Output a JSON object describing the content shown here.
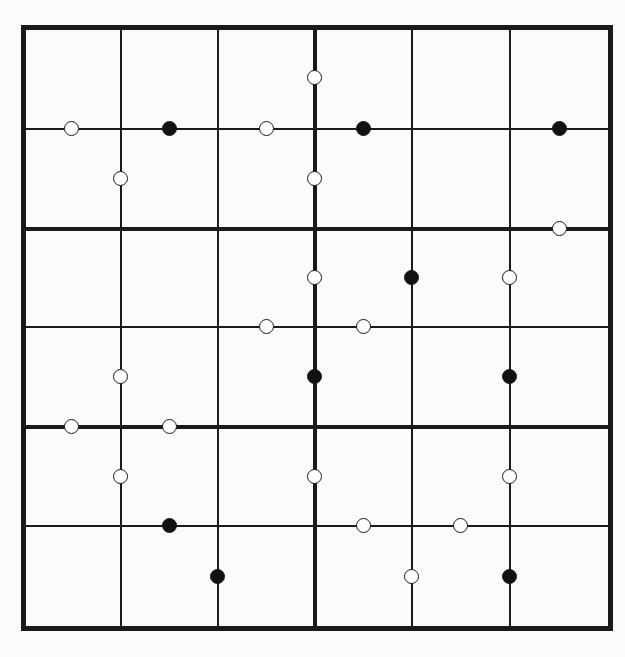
{
  "puzzle": {
    "type": "kropki",
    "size": 6,
    "box_rows": 2,
    "box_cols": 3,
    "colors": {
      "line": "#1a1a1a",
      "white_dot": "#ffffff",
      "black_dot": "#111111",
      "background": "#fbfbfa"
    },
    "geometry": {
      "col_x": [
        23,
        121,
        218,
        315,
        412,
        510,
        610
      ],
      "row_y": [
        27,
        129,
        229,
        327,
        427,
        526,
        628
      ],
      "thick_cols": [
        0,
        3,
        6
      ],
      "thick_rows": [
        0,
        2,
        4,
        6
      ]
    },
    "dots": [
      {
        "color": "white",
        "orient": "v",
        "row": 0,
        "between_cols": [
          2,
          3
        ]
      },
      {
        "color": "white",
        "orient": "h",
        "col": 0,
        "between_rows": [
          0,
          1
        ]
      },
      {
        "color": "black",
        "orient": "h",
        "col": 1,
        "between_rows": [
          0,
          1
        ]
      },
      {
        "color": "white",
        "orient": "h",
        "col": 2,
        "between_rows": [
          0,
          1
        ]
      },
      {
        "color": "black",
        "orient": "h",
        "col": 3,
        "between_rows": [
          0,
          1
        ]
      },
      {
        "color": "black",
        "orient": "h",
        "col": 5,
        "between_rows": [
          0,
          1
        ]
      },
      {
        "color": "white",
        "orient": "v",
        "row": 1,
        "between_cols": [
          0,
          1
        ]
      },
      {
        "color": "white",
        "orient": "v",
        "row": 1,
        "between_cols": [
          2,
          3
        ]
      },
      {
        "color": "white",
        "orient": "h",
        "col": 5,
        "between_rows": [
          1,
          2
        ]
      },
      {
        "color": "white",
        "orient": "v",
        "row": 2,
        "between_cols": [
          2,
          3
        ]
      },
      {
        "color": "black",
        "orient": "v",
        "row": 2,
        "between_cols": [
          3,
          4
        ]
      },
      {
        "color": "white",
        "orient": "v",
        "row": 2,
        "between_cols": [
          4,
          5
        ]
      },
      {
        "color": "white",
        "orient": "h",
        "col": 2,
        "between_rows": [
          2,
          3
        ]
      },
      {
        "color": "white",
        "orient": "h",
        "col": 3,
        "between_rows": [
          2,
          3
        ]
      },
      {
        "color": "white",
        "orient": "v",
        "row": 3,
        "between_cols": [
          0,
          1
        ]
      },
      {
        "color": "black",
        "orient": "v",
        "row": 3,
        "between_cols": [
          2,
          3
        ]
      },
      {
        "color": "black",
        "orient": "v",
        "row": 3,
        "between_cols": [
          4,
          5
        ]
      },
      {
        "color": "white",
        "orient": "h",
        "col": 0,
        "between_rows": [
          3,
          4
        ]
      },
      {
        "color": "white",
        "orient": "h",
        "col": 1,
        "between_rows": [
          3,
          4
        ]
      },
      {
        "color": "white",
        "orient": "v",
        "row": 4,
        "between_cols": [
          0,
          1
        ]
      },
      {
        "color": "white",
        "orient": "v",
        "row": 4,
        "between_cols": [
          2,
          3
        ]
      },
      {
        "color": "white",
        "orient": "v",
        "row": 4,
        "between_cols": [
          4,
          5
        ]
      },
      {
        "color": "black",
        "orient": "h",
        "col": 1,
        "between_rows": [
          4,
          5
        ]
      },
      {
        "color": "white",
        "orient": "h",
        "col": 3,
        "between_rows": [
          4,
          5
        ]
      },
      {
        "color": "white",
        "orient": "h",
        "col": 4,
        "between_rows": [
          4,
          5
        ]
      },
      {
        "color": "black",
        "orient": "v",
        "row": 5,
        "between_cols": [
          1,
          2
        ]
      },
      {
        "color": "white",
        "orient": "v",
        "row": 5,
        "between_cols": [
          3,
          4
        ]
      },
      {
        "color": "black",
        "orient": "v",
        "row": 5,
        "between_cols": [
          4,
          5
        ]
      }
    ],
    "cells": [
      [
        "",
        "",
        "",
        "",
        "",
        ""
      ],
      [
        "",
        "",
        "",
        "",
        "",
        ""
      ],
      [
        "",
        "",
        "",
        "",
        "",
        ""
      ],
      [
        "",
        "",
        "",
        "",
        "",
        ""
      ],
      [
        "",
        "",
        "",
        "",
        "",
        ""
      ],
      [
        "",
        "",
        "",
        "",
        "",
        ""
      ]
    ]
  }
}
